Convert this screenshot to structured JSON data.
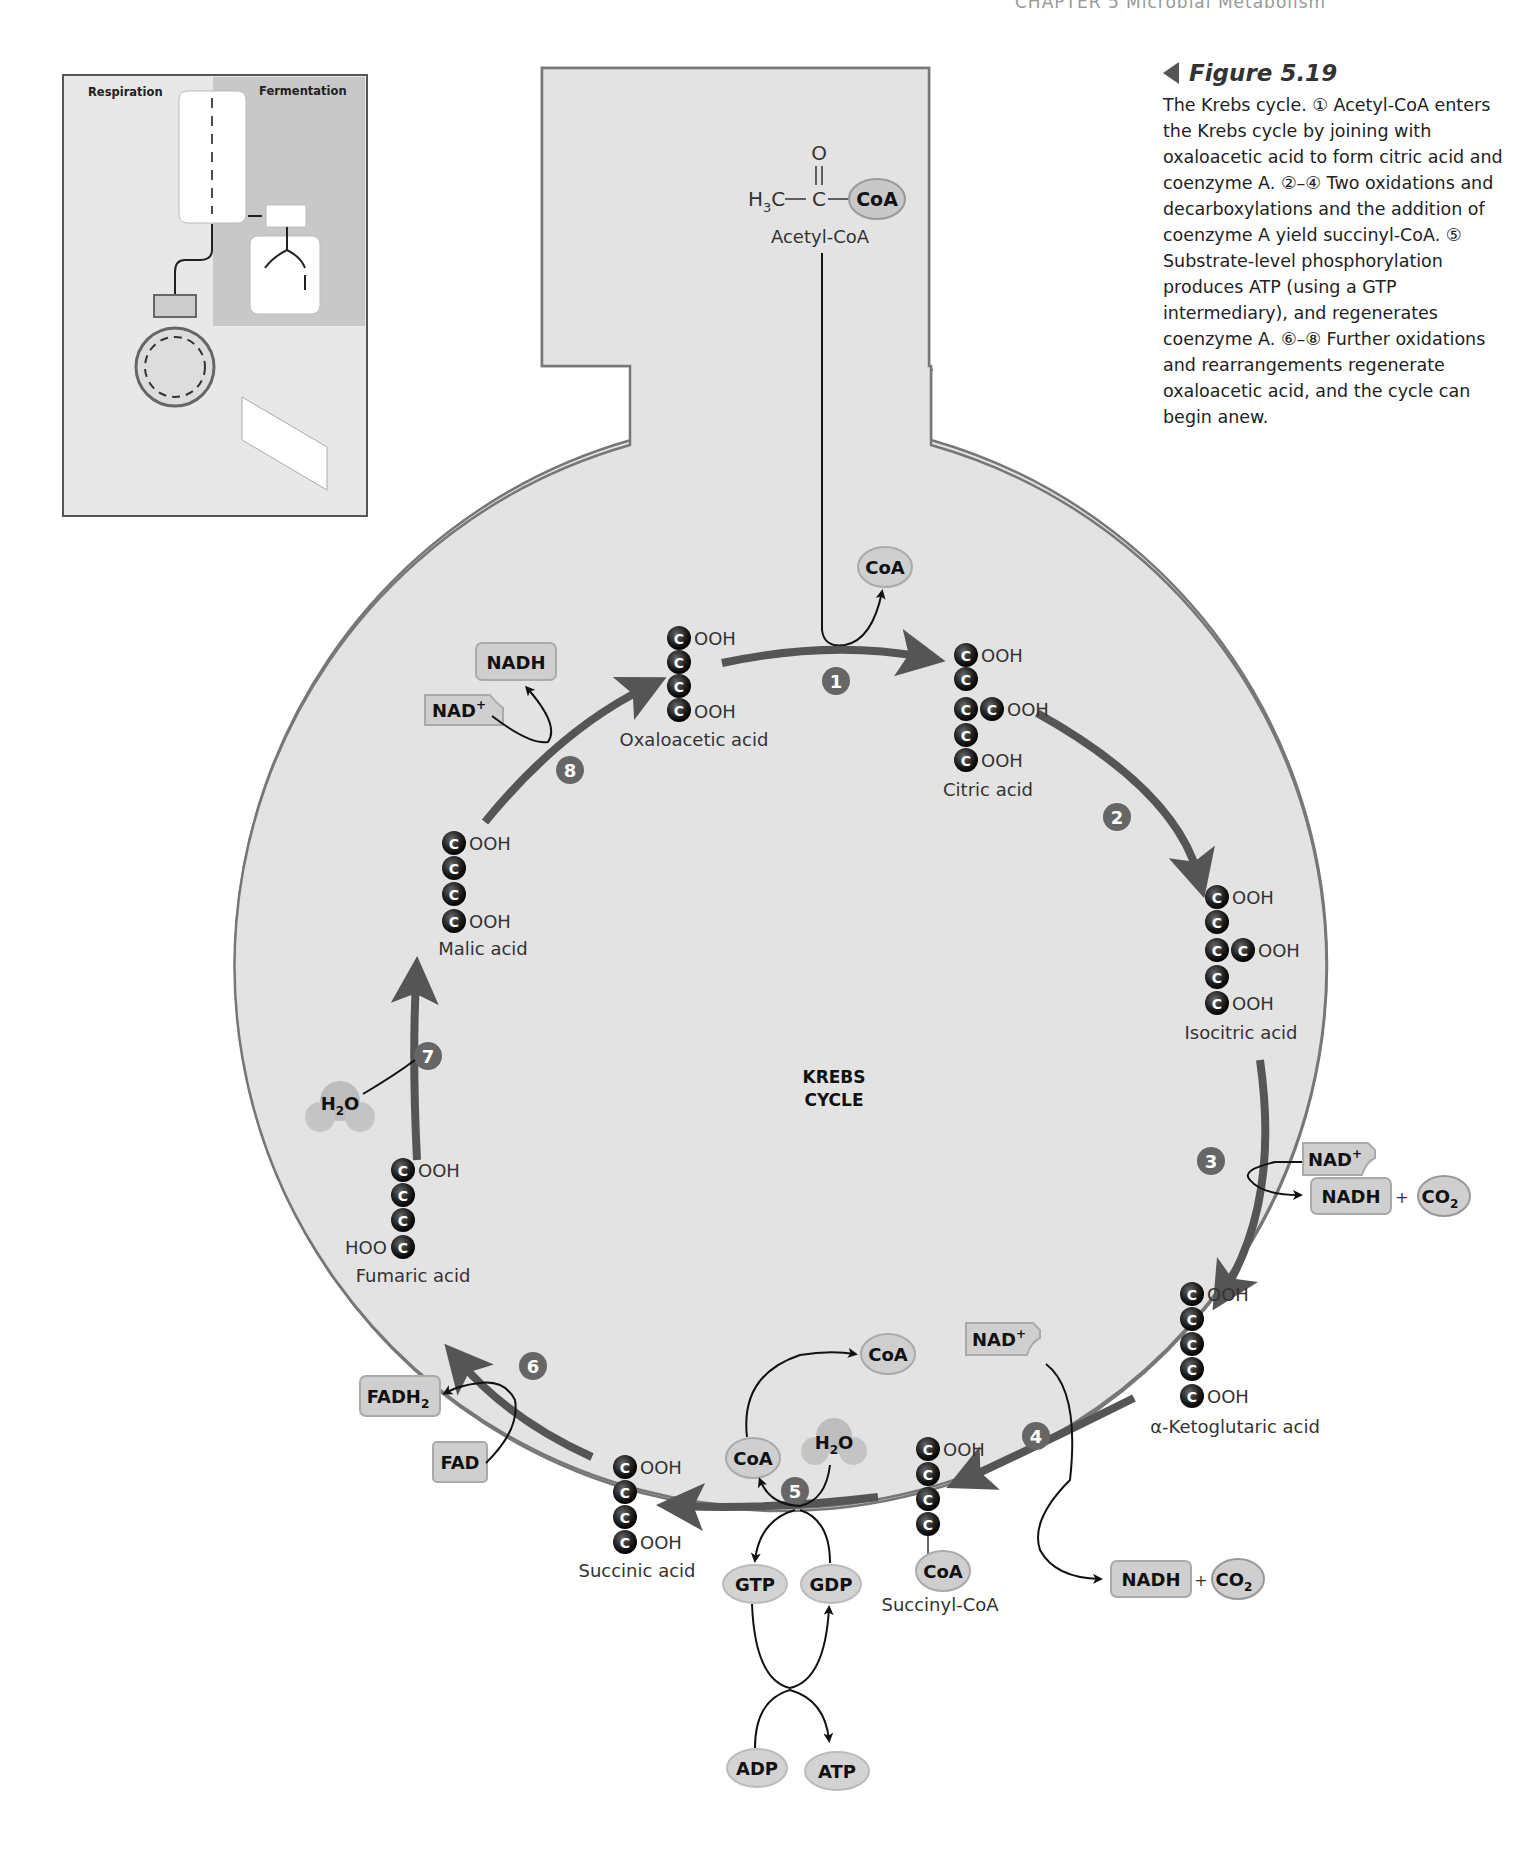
{
  "running_head": "CHAPTER 5   Microbial Metabolism",
  "caption": {
    "figure_label": "Figure 5.19",
    "text": "The Krebs cycle. ① Acetyl-CoA enters the Krebs cycle by joining with oxaloacetic acid to form citric acid and coenzyme A. ②–④ Two oxidations and decarboxylations and the addition of coenzyme A yield succinyl-CoA. ⑤ Substrate-level phosphorylation produces ATP (using a GTP intermediary), and regenerates coenzyme A. ⑥–⑧ Further oxidations and rearrangements regenerate oxaloacetic acid, and the cycle can begin anew."
  },
  "inset": {
    "respiration_label": "Respiration",
    "fermentation_label": "Fermentation"
  },
  "diagram": {
    "center_label_1": "KREBS",
    "center_label_2": "CYCLE",
    "acetyl": {
      "o": "O",
      "h3c": "H",
      "h3c_sub": "3",
      "h3c_c": "C",
      "c": "C",
      "coa": "CoA",
      "name": "Acetyl-CoA"
    },
    "cooh": "OOH",
    "hoo": "HOO",
    "carbon": "C",
    "compounds": {
      "oxaloacetic": "Oxaloacetic acid",
      "citric": "Citric acid",
      "isocitric": "Isocitric acid",
      "ketoglutaric": "α-Ketoglutaric acid",
      "succinyl_coa": "Succinyl-CoA",
      "succinic": "Succinic acid",
      "fumaric": "Fumaric acid",
      "malic": "Malic acid"
    },
    "steps": [
      "1",
      "2",
      "3",
      "4",
      "5",
      "6",
      "7",
      "8"
    ],
    "cofactors": {
      "coa": "CoA",
      "nad_plus": "NAD",
      "plus_sup": "+",
      "nadh": "NADH",
      "co2": "CO",
      "sub2": "2",
      "h2o_h": "H",
      "h2o_o": "O",
      "gtp": "GTP",
      "gdp": "GDP",
      "adp": "ADP",
      "atp": "ATP",
      "fadh2": "FADH",
      "fad": "FAD",
      "plus": "+"
    }
  },
  "colors": {
    "cycle_fill": "#e3e3e3",
    "cycle_stroke": "#777777",
    "arrow": "#555555",
    "step_badge": "#666666",
    "carbon": "#1a1a1a",
    "cofactor_fill": "#cfcfcf"
  }
}
